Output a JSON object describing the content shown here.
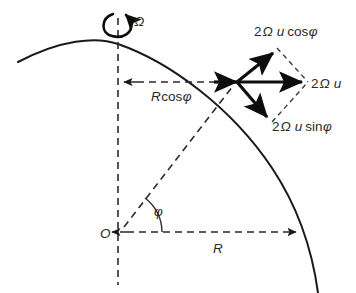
{
  "figure": {
    "background_color": "#ffffff",
    "line_color": "#1a1a1a",
    "text_color": "#2a2a2a"
  },
  "labels": {
    "omega": "Ω",
    "cos_component": "2Ω u cosφ",
    "full_vector": "2Ω u",
    "sin_component": "2Ω u sinφ",
    "r_cos_phi": "Rcosφ",
    "radius": "R",
    "origin": "O",
    "angle": "φ"
  },
  "label_parts": {
    "cos_coef": "2",
    "cos_omega": "Ω",
    "cos_u": "u",
    "cos_fn": "cos",
    "cos_phi": "φ",
    "vec_coef": "2",
    "vec_omega": "Ω",
    "vec_u": "u",
    "sin_coef": "2",
    "sin_omega": "Ω",
    "sin_u": "u",
    "sin_fn": "sin",
    "sin_phi": "φ",
    "rcos_r": "R",
    "rcos_fn": "cos",
    "rcos_phi": "φ"
  },
  "geometry": {
    "origin_x": 118,
    "origin_y": 232,
    "point_x": 237,
    "point_y": 82,
    "pole_x": 118,
    "pole_y": 44,
    "equator_x": 301,
    "equator_y": 232,
    "latitude_angle_deg": 52,
    "vector_east_tip_x": 308,
    "vector_east_tip_y": 82,
    "vector_cos_tip_x": 277,
    "vector_cos_tip_y": 48,
    "vector_sin_tip_x": 272,
    "vector_sin_tip_y": 122
  }
}
